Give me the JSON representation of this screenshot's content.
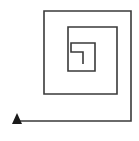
{
  "figure": {
    "title": "Square Spiral",
    "type": "line-diagram",
    "canvas": {
      "width": 139,
      "height": 141,
      "background_color": "#ffffff"
    },
    "stroke": {
      "color": "#3a3a3a",
      "width": 1.6,
      "linecap": "butt",
      "linejoin": "miter"
    },
    "arrow": {
      "name": "arrowhead",
      "shape": "solid-triangle",
      "direction": "up",
      "color": "#1a1a1a",
      "tip": {
        "x": 17,
        "y": 113
      },
      "base_left": {
        "x": 12,
        "y": 124
      },
      "base_right": {
        "x": 22,
        "y": 124
      }
    },
    "geometry": {
      "turns": 3.5,
      "winding": "counterclockwise-outward",
      "center": {
        "x": 83,
        "y": 52
      },
      "vertices": [
        {
          "x": 83,
          "y": 64
        },
        {
          "x": 83,
          "y": 52
        },
        {
          "x": 71,
          "y": 52
        },
        {
          "x": 71,
          "y": 43
        },
        {
          "x": 95,
          "y": 43
        },
        {
          "x": 95,
          "y": 71
        },
        {
          "x": 68,
          "y": 71
        },
        {
          "x": 68,
          "y": 43
        },
        {
          "x": 68,
          "y": 27
        },
        {
          "x": 117,
          "y": 27
        },
        {
          "x": 117,
          "y": 94
        },
        {
          "x": 44,
          "y": 94
        },
        {
          "x": 44,
          "y": 27
        },
        {
          "x": 44,
          "y": 11
        },
        {
          "x": 131,
          "y": 11
        },
        {
          "x": 131,
          "y": 121
        },
        {
          "x": 17,
          "y": 121
        }
      ],
      "path_d": "M 83 64 L 83 52 L 71 52 L 71 43 L 95 43 L 95 71 L 68 71 L 68 27 L 117 27 L 117 94 L 44 94 L 44 11 L 131 11 L 131 121 L 17 121"
    },
    "rings": [
      {
        "name": "outer-ring",
        "left": 30,
        "top": 11,
        "right": 131,
        "bottom": 121,
        "note": "Outermost loop; bottom edge extends past the left side to the arrowhead."
      },
      {
        "name": "middle-ring",
        "left": 44,
        "top": 27,
        "right": 117,
        "bottom": 94,
        "note": "Second loop."
      },
      {
        "name": "inner-ring",
        "left": 68,
        "top": 43,
        "right": 95,
        "bottom": 71,
        "note": "Third loop, open at the top-right."
      },
      {
        "name": "core-stub",
        "left": 71,
        "top": 52,
        "right": 83,
        "bottom": 64,
        "note": "Innermost short hook at the centre of the spiral."
      }
    ]
  }
}
